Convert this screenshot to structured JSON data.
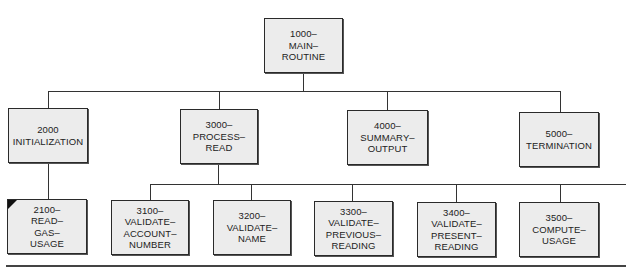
{
  "diagram": {
    "type": "hierarchy-chart",
    "root": {
      "id": "1000",
      "lines": [
        "1000–",
        "MAIN–",
        "ROUTINE"
      ]
    },
    "level2": [
      {
        "id": "2000",
        "lines": [
          "2000",
          "INITIALIZATION"
        ]
      },
      {
        "id": "3000",
        "lines": [
          "3000–",
          "PROCESS–",
          "READ"
        ]
      },
      {
        "id": "4000",
        "lines": [
          "4000–",
          "SUMMARY–",
          "OUTPUT"
        ]
      },
      {
        "id": "5000",
        "lines": [
          "5000–",
          "TERMINATION"
        ]
      }
    ],
    "level3": [
      {
        "id": "2100",
        "parent": "2000",
        "lines": [
          "2100–",
          "READ–",
          "GAS–",
          "USAGE"
        ],
        "marked": true
      },
      {
        "id": "3100",
        "parent": "3000",
        "lines": [
          "3100–",
          "VALIDATE–",
          "ACCOUNT–",
          "NUMBER"
        ]
      },
      {
        "id": "3200",
        "parent": "3000",
        "lines": [
          "3200–",
          "VALIDATE–",
          "NAME"
        ]
      },
      {
        "id": "3300",
        "parent": "3000",
        "lines": [
          "3300–",
          "VALIDATE–",
          "PREVIOUS–",
          "READING"
        ]
      },
      {
        "id": "3400",
        "parent": "3000",
        "lines": [
          "3400–",
          "VALIDATE–",
          "PRESENT–",
          "READING"
        ]
      },
      {
        "id": "3500",
        "parent": "3000",
        "lines": [
          "3500–",
          "COMPUTE–",
          "USAGE"
        ]
      }
    ],
    "colors": {
      "box_fill": "#ececec",
      "border": "#2a2a2a",
      "line": "#333333"
    }
  }
}
